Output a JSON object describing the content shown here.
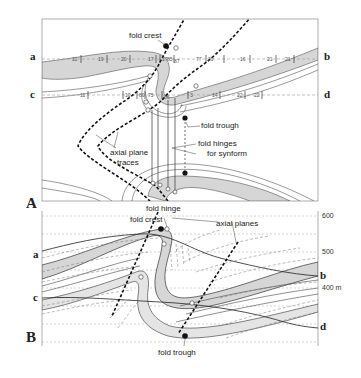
{
  "figure": {
    "panels": {
      "A": {
        "label": "A",
        "section_lines": [
          {
            "start": "a",
            "end": "b"
          },
          {
            "start": "c",
            "end": "d"
          }
        ],
        "dip_readings_a_b": [
          "11",
          "19",
          "20",
          "17",
          "17",
          "85",
          "87",
          "77",
          "20",
          "16",
          "21",
          "21"
        ],
        "dip_readings_c_d": [
          "11",
          "10",
          "80",
          "75",
          "86",
          "3",
          "14",
          "22",
          "22"
        ],
        "annotations": {
          "fold_crest": "fold crest",
          "fold_trough": "fold trough",
          "fold_hinges_line1": "fold hinges",
          "fold_hinges_line2": "for synform",
          "axial_plane_traces_line1": "axial plane",
          "axial_plane_traces_line2": "traces"
        }
      },
      "B": {
        "label": "B",
        "section_lines": [
          {
            "start": "a",
            "end": "b"
          },
          {
            "start": "c",
            "end": "d"
          }
        ],
        "elevations": [
          "600",
          "500",
          "400 m"
        ],
        "annotations": {
          "fold_hinge": "fold hinge",
          "fold_crest": "fold crest",
          "axial_planes": "axial planes",
          "fold_trough": "fold trough"
        }
      }
    },
    "endpoint_labels": {
      "a": "a",
      "b": "b",
      "c": "c",
      "d": "d"
    },
    "colors": {
      "layer_fill": "#d6d6d6",
      "line": "#333333",
      "dashed_guide": "#9a9a9a",
      "axial_trace": "#111111"
    }
  }
}
